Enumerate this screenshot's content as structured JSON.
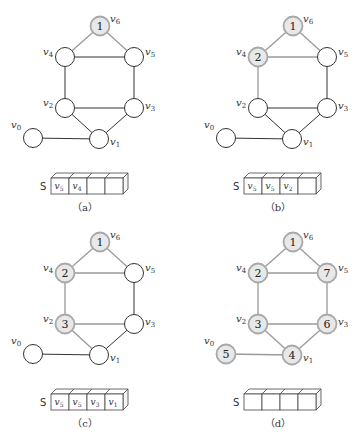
{
  "figure": {
    "panels": [
      {
        "id": "a",
        "caption": "（a）",
        "offset": [
          0,
          0
        ],
        "visit_order": {
          "v6": "1"
        },
        "stack": [
          "v5",
          "v4",
          "",
          ""
        ]
      },
      {
        "id": "b",
        "caption": "（b）",
        "offset": [
          193,
          0
        ],
        "visit_order": {
          "v6": "1",
          "v4": "2"
        },
        "stack": [
          "v5",
          "v5",
          "v2",
          ""
        ]
      },
      {
        "id": "c",
        "caption": "（c）",
        "offset": [
          0,
          216
        ],
        "visit_order": {
          "v6": "1",
          "v4": "2",
          "v2": "3"
        },
        "stack": [
          "v5",
          "v5",
          "v3",
          "v1"
        ]
      },
      {
        "id": "d",
        "caption": "（d）",
        "offset": [
          193,
          216
        ],
        "visit_order": {
          "v6": "1",
          "v4": "2",
          "v2": "3",
          "v1": "4",
          "v0": "5",
          "v3": "6",
          "v5": "7"
        },
        "stack": [
          "",
          "",
          "",
          ""
        ]
      }
    ],
    "nodes": [
      {
        "id": "v0",
        "label": "v",
        "sub": "0",
        "x": 33,
        "y": 138,
        "lx": -22,
        "ly": -10
      },
      {
        "id": "v1",
        "label": "v",
        "sub": "1",
        "x": 99,
        "y": 139,
        "lx": 11,
        "ly": 6
      },
      {
        "id": "v2",
        "label": "v",
        "sub": "2",
        "x": 65,
        "y": 108,
        "lx": -22,
        "ly": -2
      },
      {
        "id": "v3",
        "label": "v",
        "sub": "3",
        "x": 134,
        "y": 108,
        "lx": 11,
        "ly": 1
      },
      {
        "id": "v4",
        "label": "v",
        "sub": "4",
        "x": 65,
        "y": 57,
        "lx": -22,
        "ly": -2
      },
      {
        "id": "v5",
        "label": "v",
        "sub": "5",
        "x": 134,
        "y": 57,
        "lx": 11,
        "ly": -2
      },
      {
        "id": "v6",
        "label": "v",
        "sub": "6",
        "x": 100,
        "y": 26,
        "lx": 10,
        "ly": -4
      }
    ],
    "edges": [
      [
        "v6",
        "v4"
      ],
      [
        "v6",
        "v5"
      ],
      [
        "v4",
        "v5"
      ],
      [
        "v4",
        "v2"
      ],
      [
        "v5",
        "v3"
      ],
      [
        "v2",
        "v3"
      ],
      [
        "v2",
        "v1"
      ],
      [
        "v3",
        "v1"
      ],
      [
        "v0",
        "v1"
      ]
    ],
    "node_radius": 9.5,
    "stack_label": "S",
    "stack_geom": {
      "sx": 45,
      "x": 51,
      "y": 178,
      "cell_w": 18,
      "cell_h": 16,
      "depth": 5
    },
    "caption_pos": {
      "x": 85,
      "y": 211
    },
    "colors": {
      "visited_fill": "#e8e8e8",
      "visited_stroke": "#a8a8a8",
      "unvisited_stroke": "#333333",
      "visited_edge": "#9a9a9a"
    }
  }
}
